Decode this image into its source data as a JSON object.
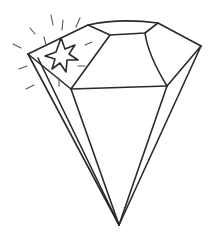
{
  "illustration": {
    "subject": "diamond gem line drawing",
    "icon": "diamond-icon",
    "accent_icon": "sparkle-star-icon",
    "stroke_color": "#2a2a2a",
    "background_color": "#ffffff"
  }
}
